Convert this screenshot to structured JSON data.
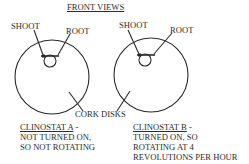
{
  "diagram": {
    "title": "FRONT VIEWS",
    "labels": {
      "shoot": "SHOOT",
      "root": "ROOT",
      "cork_disks": "CORK DISKS"
    },
    "clinostats": [
      {
        "id": "A",
        "heading": "CLINOSTAT A",
        "heading_suffix": " -",
        "lines": [
          "NOT TURNED ON,",
          "SO NOT ROTATING"
        ],
        "disk": {
          "cx": 52,
          "cy": 77,
          "r": 37
        },
        "seed": {
          "cx": 50,
          "cy": 61,
          "r": 6
        },
        "bar": {
          "x1": 41,
          "x2": 59,
          "y": 56
        }
      },
      {
        "id": "B",
        "heading": "CLINOSTAT B",
        "heading_suffix": " -",
        "lines": [
          "TURNED ON, SO",
          "ROTATING AT 4",
          "REVOLUTIONS PER HOUR"
        ],
        "disk": {
          "cx": 151,
          "cy": 75,
          "r": 37
        },
        "seed": {
          "cx": 145,
          "cy": 60,
          "r": 6
        },
        "bar": {
          "x1": 137,
          "x2": 155,
          "y": 55
        }
      }
    ],
    "colors": {
      "stroke": "#2a2a2a",
      "text": "#2c2c2c",
      "background": "#ffffff"
    }
  }
}
